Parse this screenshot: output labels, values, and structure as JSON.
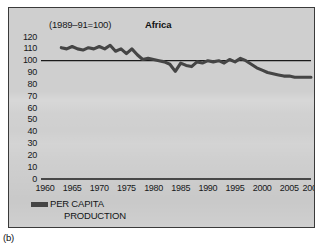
{
  "figure": {
    "panel_label": "(b)",
    "background_color": "#cfcfcf",
    "frame_color": "#3a3a3a",
    "series_color": "#454545"
  },
  "chart_data": {
    "type": "line",
    "title": "Africa",
    "subtitle": "(1989–91=100)",
    "xlabel": "",
    "ylabel": "",
    "xlim": [
      1960,
      2009
    ],
    "ylim": [
      0,
      120
    ],
    "grid": false,
    "reference_line": {
      "value": 100,
      "label": "100",
      "orientation": "horizontal"
    },
    "ytick_labels": [
      "120",
      "110",
      "100",
      "90",
      "80",
      "70",
      "60",
      "50",
      "40",
      "30",
      "20",
      "10",
      "0"
    ],
    "ytick_values": [
      120,
      110,
      100,
      90,
      80,
      70,
      60,
      50,
      40,
      30,
      20,
      10,
      0
    ],
    "xtick_labels": [
      "1960",
      "1965",
      "1970",
      "1975",
      "1980",
      "1985",
      "1990",
      "1995",
      "2000",
      "2005",
      "2009"
    ],
    "xtick_values": [
      1960,
      1965,
      1970,
      1975,
      1980,
      1985,
      1990,
      1995,
      2000,
      2005,
      2009
    ],
    "legend_position": "below-axis-left",
    "legend": [
      "PER CAPITA PRODUCTION"
    ],
    "series": [
      {
        "name": "PER CAPITA PRODUCTION",
        "color": "#454545",
        "x": [
          1963,
          1964,
          1965,
          1966,
          1967,
          1968,
          1969,
          1970,
          1971,
          1972,
          1973,
          1974,
          1975,
          1976,
          1977,
          1978,
          1979,
          1980,
          1981,
          1982,
          1983,
          1984,
          1985,
          1986,
          1987,
          1988,
          1989,
          1990,
          1991,
          1992,
          1993,
          1994,
          1995,
          1996,
          1997,
          1998,
          1999,
          2000,
          2001,
          2002,
          2003,
          2004,
          2005,
          2006,
          2007,
          2008,
          2009
        ],
        "values": [
          111,
          110,
          112,
          110,
          109,
          111,
          110,
          112,
          110,
          113,
          108,
          110,
          106,
          110,
          105,
          101,
          102,
          101,
          100,
          99,
          97,
          91,
          98,
          96,
          95,
          99,
          98,
          100,
          99,
          100,
          98,
          101,
          99,
          102,
          100,
          97,
          94,
          92,
          90,
          89,
          88,
          87,
          87,
          86,
          86,
          86,
          86
        ]
      }
    ]
  },
  "axis_geometry": {
    "plot_left_px": 36,
    "plot_right_px": 302,
    "zero_y_px": 171,
    "unit_y_px": 1.183
  }
}
